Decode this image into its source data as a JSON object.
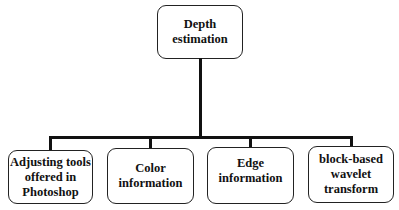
{
  "diagram": {
    "type": "tree",
    "root": {
      "label_line1": "Depth",
      "label_line2": "estimation"
    },
    "children": [
      {
        "line1": "Adjusting tools",
        "line2": "offered in",
        "line3": "Photoshop"
      },
      {
        "line1": "Color",
        "line2": "information"
      },
      {
        "line1": "Edge",
        "line2": "information"
      },
      {
        "line1": "block-based",
        "line2": "wavelet",
        "line3": "transform"
      }
    ],
    "colors": {
      "line": "#111111",
      "border": "#222222",
      "background": "#ffffff"
    }
  }
}
